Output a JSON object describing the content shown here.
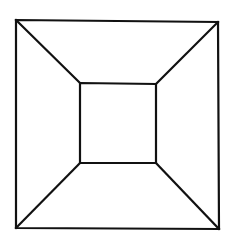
{
  "figure": {
    "background": "#ffffff",
    "stroke_color": "#111111",
    "stroke_width": 2.2,
    "outer_square": {
      "top_left": [
        16,
        20
      ],
      "top_right": [
        218,
        22
      ],
      "bottom_right": [
        219,
        229
      ],
      "bottom_left": [
        16,
        228
      ]
    },
    "inner_square": {
      "top_left": [
        80,
        83
      ],
      "top_right": [
        156,
        84
      ],
      "bottom_right": [
        156,
        163
      ],
      "bottom_left": [
        80,
        163
      ]
    },
    "connectors": [
      {
        "name": "top-left",
        "from": [
          16,
          20
        ],
        "to": [
          80,
          83
        ]
      },
      {
        "name": "top-right",
        "from": [
          218,
          22
        ],
        "to": [
          156,
          84
        ]
      },
      {
        "name": "bottom-right",
        "from": [
          219,
          229
        ],
        "to": [
          156,
          163
        ]
      },
      {
        "name": "bottom-left",
        "from": [
          16,
          228
        ],
        "to": [
          80,
          163
        ]
      }
    ]
  }
}
